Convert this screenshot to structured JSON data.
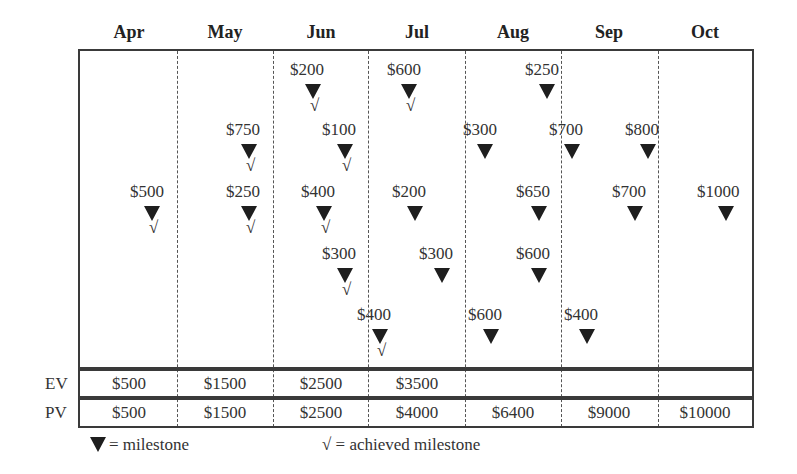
{
  "months": [
    "Apr",
    "May",
    "Jun",
    "Jul",
    "Aug",
    "Sep",
    "Oct"
  ],
  "milestones": [
    {
      "label": "$200",
      "x": 290,
      "y": 61,
      "tri_x": 305,
      "achieved": true
    },
    {
      "label": "$600",
      "x": 387,
      "y": 61,
      "tri_x": 401,
      "achieved": true
    },
    {
      "label": "$250",
      "x": 525,
      "y": 61,
      "tri_x": 539,
      "achieved": false
    },
    {
      "label": "$750",
      "x": 226,
      "y": 121,
      "tri_x": 241,
      "achieved": true
    },
    {
      "label": "$100",
      "x": 322,
      "y": 121,
      "tri_x": 337,
      "achieved": true
    },
    {
      "label": "$300",
      "x": 463,
      "y": 121,
      "tri_x": 477,
      "achieved": false
    },
    {
      "label": "$700",
      "x": 549,
      "y": 121,
      "tri_x": 564,
      "achieved": false
    },
    {
      "label": "$800",
      "x": 625,
      "y": 121,
      "tri_x": 640,
      "achieved": false
    },
    {
      "label": "$500",
      "x": 130,
      "y": 183,
      "tri_x": 144,
      "achieved": true
    },
    {
      "label": "$250",
      "x": 226,
      "y": 183,
      "tri_x": 241,
      "achieved": true
    },
    {
      "label": "$400",
      "x": 301,
      "y": 183,
      "tri_x": 316,
      "achieved": true
    },
    {
      "label": "$200",
      "x": 392,
      "y": 183,
      "tri_x": 407,
      "achieved": false
    },
    {
      "label": "$650",
      "x": 516,
      "y": 183,
      "tri_x": 531,
      "achieved": false
    },
    {
      "label": "$700",
      "x": 612,
      "y": 183,
      "tri_x": 627,
      "achieved": false
    },
    {
      "label": "$1000",
      "x": 697,
      "y": 183,
      "tri_x": 718,
      "achieved": false
    },
    {
      "label": "$300",
      "x": 322,
      "y": 245,
      "tri_x": 337,
      "achieved": true
    },
    {
      "label": "$300",
      "x": 419,
      "y": 245,
      "tri_x": 434,
      "achieved": false
    },
    {
      "label": "$600",
      "x": 516,
      "y": 245,
      "tri_x": 531,
      "achieved": false
    },
    {
      "label": "$400",
      "x": 357,
      "y": 306,
      "tri_x": 372,
      "achieved": true
    },
    {
      "label": "$600",
      "x": 468,
      "y": 306,
      "tri_x": 483,
      "achieved": false
    },
    {
      "label": "$400",
      "x": 564,
      "y": 306,
      "tri_x": 579,
      "achieved": false
    }
  ],
  "ev": {
    "label": "EV",
    "values": [
      "$500",
      "$1500",
      "$2500",
      "$3500",
      "",
      "",
      ""
    ]
  },
  "pv": {
    "label": "PV",
    "values": [
      "$500",
      "$1500",
      "$2500",
      "$4000",
      "$6400",
      "$9000",
      "$10000"
    ]
  },
  "legend": {
    "milestone": "= milestone",
    "achieved_symbol": "√",
    "achieved": "= achieved milestone"
  },
  "check_symbol": "√",
  "colors": {
    "marker": "#1e1e1e",
    "lines": "#3a3a3a",
    "text": "#333333"
  }
}
